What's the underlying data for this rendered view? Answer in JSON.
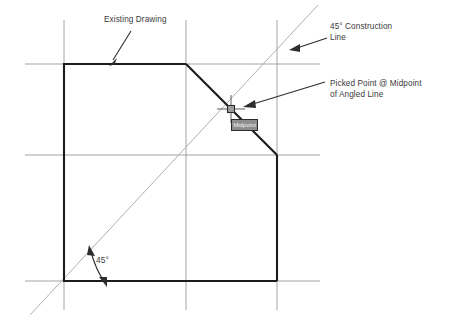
{
  "diagram": {
    "colors": {
      "background": "#ffffff",
      "grid_line": "#9a9a9a",
      "object_line": "#1c1c1c",
      "construction_line": "#b0b0b0",
      "leader_line": "#2e2e2e",
      "text": "#3a3a3a",
      "tooltip_fill": "#8d8d8d",
      "tooltip_border": "#2b2b2b",
      "tooltip_text": "#f2f2f2",
      "snap_marker": "#3d3d3d"
    },
    "annotations": {
      "existing_drawing": "Existing Drawing",
      "construction_line": "45° Construction\nLine",
      "picked_point": "Picked Point @ Midpoint\nof Angled Line",
      "angle_value": "45°"
    },
    "tooltip": {
      "label": "Midpoint"
    },
    "grid": {
      "vertical_x": [
        64,
        186,
        277
      ],
      "horizontal_y": [
        64,
        155,
        281
      ]
    },
    "shape": {
      "name": "existing-drawing-outline",
      "points": "64,64 186,64 277,155 277,281 64,281 64,64"
    },
    "construction_line_geometry": {
      "x1": 30,
      "y1": 315,
      "x2": 318,
      "y2": 5,
      "angle_degrees": 45
    },
    "picked_point": {
      "x": 231,
      "y": 109,
      "snap_type": "Midpoint"
    }
  }
}
